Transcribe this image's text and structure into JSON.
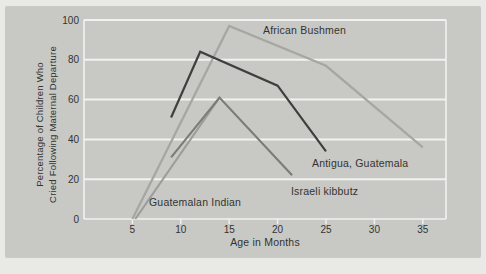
{
  "figure": {
    "panel_bg": "#c8c9c5",
    "page_bg": "#e9eae6",
    "grid_color": "#f2f2f0",
    "axis_text_color": "#333331"
  },
  "chart_data": {
    "type": "line",
    "title": "",
    "xlabel": "Age in Months",
    "ylabel_lines": [
      "Percentage of Children Who",
      "Cried Following Maternal Departure"
    ],
    "x_ticks": [
      5,
      10,
      15,
      20,
      25,
      30,
      35
    ],
    "y_ticks": [
      0,
      20,
      40,
      60,
      80,
      100
    ],
    "xlim": [
      0,
      37.5
    ],
    "ylim": [
      0,
      100
    ],
    "grid": "horizontal white gridlines on gray panel, white left/right frame",
    "legend_position": "inline labels beside each line",
    "series": [
      {
        "name": "African Bushmen",
        "color": "#a6a7a3",
        "stroke_width": 2.3,
        "points": [
          [
            5,
            0
          ],
          [
            15,
            97
          ],
          [
            25,
            77
          ],
          [
            35,
            36
          ]
        ],
        "label_xy": [
          263,
          34
        ]
      },
      {
        "name": "Guatemalan Indian",
        "color": "#9c9d99",
        "stroke_width": 2.1,
        "points": [
          [
            5.3,
            0
          ],
          [
            14,
            61
          ]
        ],
        "label_xy": [
          149,
          206
        ]
      },
      {
        "name": "Israeli kibbutz",
        "color": "#7b7c78",
        "stroke_width": 2.1,
        "points": [
          [
            9,
            31
          ],
          [
            14,
            61
          ],
          [
            21.5,
            22
          ]
        ],
        "label_xy": [
          291,
          195
        ]
      },
      {
        "name": "Antigua, Guatemala",
        "color": "#3f403e",
        "stroke_width": 2.2,
        "points": [
          [
            9,
            51
          ],
          [
            12,
            84
          ],
          [
            20,
            67
          ],
          [
            25,
            34
          ]
        ],
        "label_xy": [
          312,
          167
        ]
      }
    ]
  }
}
